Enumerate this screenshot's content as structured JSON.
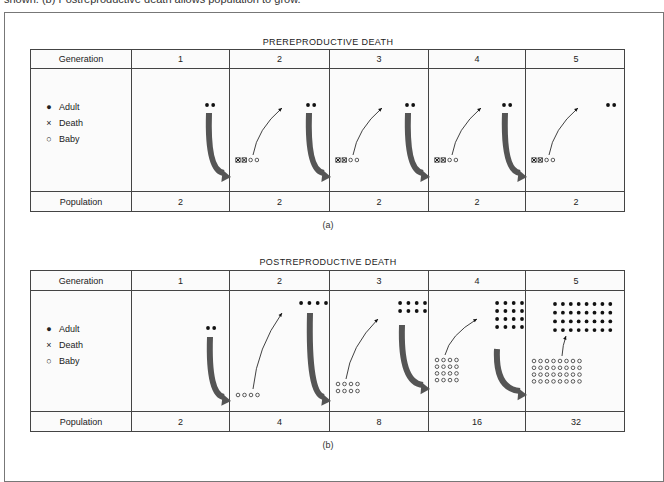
{
  "caption_fragment": "shown. (b) Postreproductive death allows population to grow.",
  "columns": {
    "header_label": "Generation",
    "population_label": "Population",
    "generations": [
      "1",
      "2",
      "3",
      "4",
      "5"
    ]
  },
  "legend": [
    {
      "symbol": "●",
      "label": "Adult",
      "icon": "filled-dot-icon"
    },
    {
      "symbol": "×",
      "label": "Death",
      "icon": "cross-icon"
    },
    {
      "symbol": "○",
      "label": "Baby",
      "icon": "open-circle-icon"
    }
  ],
  "panels": [
    {
      "id": "a",
      "title": "PREREPRODUCTIVE DEATH",
      "sub_label": "(a)",
      "population": [
        "2",
        "2",
        "2",
        "2",
        "2"
      ],
      "generations": [
        {
          "adults": [
            2,
            1
          ],
          "babies": [
            0,
            0
          ],
          "deaths": 0,
          "big_arrow": true,
          "thin_arrow": false
        },
        {
          "adults": [
            2,
            1
          ],
          "babies": [
            2,
            1
          ],
          "deaths": 2,
          "big_arrow": true,
          "thin_arrow": true
        },
        {
          "adults": [
            2,
            1
          ],
          "babies": [
            2,
            1
          ],
          "deaths": 2,
          "big_arrow": true,
          "thin_arrow": true
        },
        {
          "adults": [
            2,
            1
          ],
          "babies": [
            2,
            1
          ],
          "deaths": 2,
          "big_arrow": true,
          "thin_arrow": true
        },
        {
          "adults": [
            2,
            1
          ],
          "babies": [
            2,
            1
          ],
          "deaths": 2,
          "big_arrow": false,
          "thin_arrow": true
        }
      ]
    },
    {
      "id": "b",
      "title": "POSTREPRODUCTIVE DEATH",
      "sub_label": "(b)",
      "population": [
        "2",
        "4",
        "8",
        "16",
        "32"
      ],
      "generations": [
        {
          "adults": [
            2,
            1
          ],
          "babies": [
            0,
            0
          ],
          "deaths": 0,
          "big_arrow": true,
          "thin_arrow": false
        },
        {
          "adults": [
            4,
            1
          ],
          "babies": [
            4,
            1
          ],
          "deaths": 0,
          "big_arrow": true,
          "thin_arrow": true
        },
        {
          "adults": [
            4,
            2
          ],
          "babies": [
            4,
            2
          ],
          "deaths": 0,
          "big_arrow": true,
          "thin_arrow": true
        },
        {
          "adults": [
            4,
            4
          ],
          "babies": [
            4,
            4
          ],
          "deaths": 0,
          "big_arrow": true,
          "thin_arrow": true
        },
        {
          "adults": [
            8,
            4
          ],
          "babies": [
            8,
            4
          ],
          "deaths": 0,
          "big_arrow": false,
          "thin_arrow": true
        }
      ]
    }
  ],
  "colors": {
    "arrow": "#555555",
    "dot": "#111111",
    "border": "#444444"
  }
}
